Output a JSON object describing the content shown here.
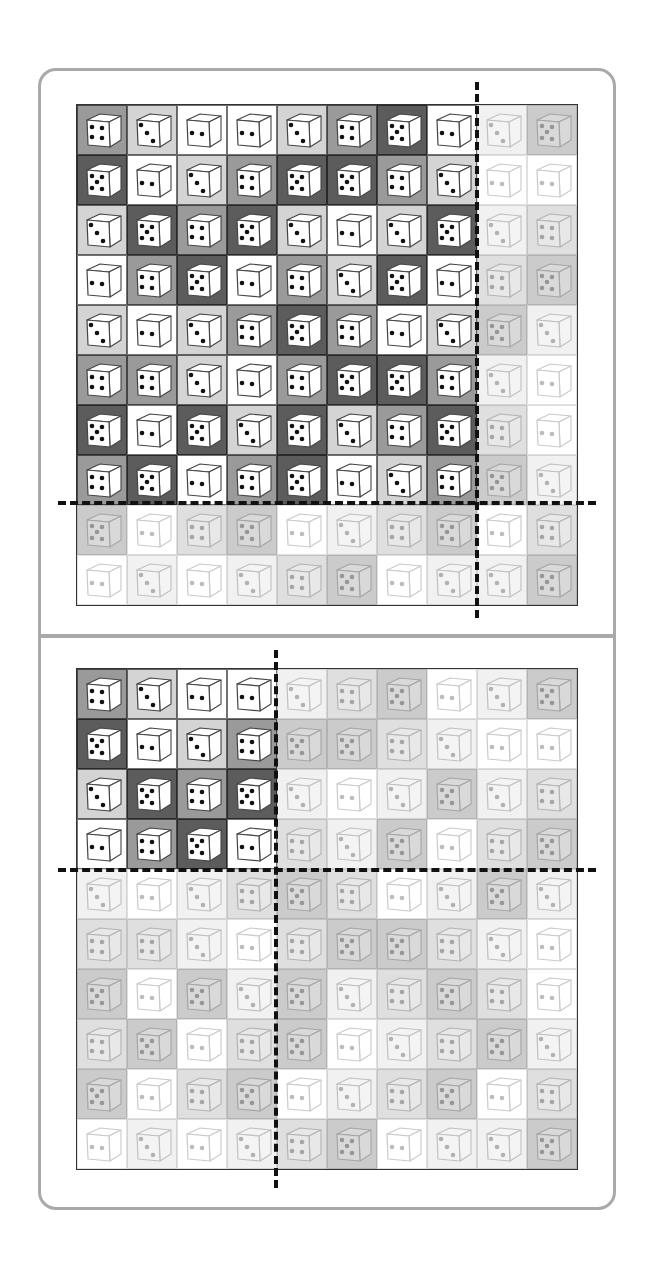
{
  "colors": {
    "2": "#ffffff",
    "3": "#d4d4d4",
    "4": "#9a9a9a",
    "5": "#5c5c5c",
    "frame": "#a9a9a9",
    "dash": "#111111"
  },
  "dice": [
    [
      4,
      3,
      2,
      2,
      3,
      4,
      5,
      2,
      3,
      5
    ],
    [
      5,
      2,
      3,
      4,
      5,
      5,
      4,
      3,
      2,
      2
    ],
    [
      3,
      5,
      4,
      5,
      3,
      2,
      3,
      5,
      3,
      4
    ],
    [
      2,
      4,
      5,
      2,
      4,
      3,
      5,
      2,
      4,
      5
    ],
    [
      3,
      2,
      3,
      4,
      5,
      4,
      2,
      3,
      5,
      3
    ],
    [
      4,
      4,
      3,
      2,
      4,
      5,
      5,
      4,
      3,
      2
    ],
    [
      5,
      2,
      5,
      3,
      5,
      3,
      4,
      5,
      4,
      2
    ],
    [
      4,
      5,
      2,
      4,
      5,
      2,
      3,
      4,
      5,
      3
    ],
    [
      5,
      2,
      4,
      5,
      2,
      3,
      4,
      5,
      2,
      4
    ],
    [
      2,
      3,
      2,
      3,
      4,
      5,
      2,
      3,
      3,
      5
    ]
  ],
  "panels": [
    {
      "name": "top-panel",
      "grid_left": 76,
      "grid_top": 104,
      "highlight_rows": 8,
      "highlight_cols": 8,
      "dash_v": {
        "left": 475,
        "top": 82,
        "height": 536
      },
      "dash_h": {
        "left": 58,
        "top": 501,
        "width": 538
      }
    },
    {
      "name": "bottom-panel",
      "grid_left": 76,
      "grid_top": 668,
      "highlight_rows": 4,
      "highlight_cols": 4,
      "dash_v": {
        "left": 274,
        "top": 650,
        "height": 538
      },
      "dash_h": {
        "left": 58,
        "top": 868,
        "width": 538
      }
    }
  ]
}
